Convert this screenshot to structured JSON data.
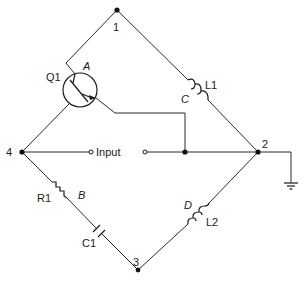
{
  "diagram": {
    "type": "circuit-schematic",
    "nodes": [
      {
        "id": "1",
        "label": "1"
      },
      {
        "id": "2",
        "label": "2"
      },
      {
        "id": "3",
        "label": "3"
      },
      {
        "id": "4",
        "label": "4"
      }
    ],
    "components": {
      "transistor": {
        "name": "Q1",
        "arm": "A"
      },
      "inductor_top": {
        "name": "L1",
        "arm": "C"
      },
      "resistor": {
        "name": "R1",
        "arm": "B"
      },
      "capacitor": {
        "name": "C1"
      },
      "inductor_bottom": {
        "name": "L2",
        "arm": "D"
      }
    },
    "input": {
      "label": "Input"
    },
    "ground": {
      "symbol": "ground"
    }
  }
}
